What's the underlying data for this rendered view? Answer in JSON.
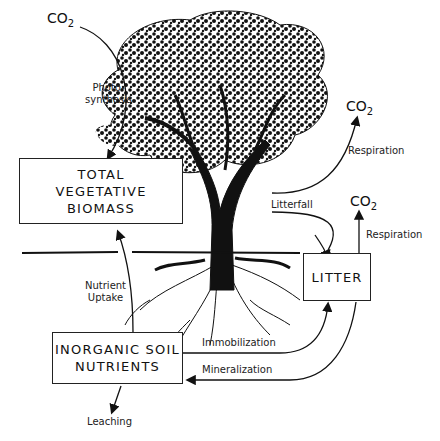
{
  "diagram": {
    "boxes": {
      "biomass": {
        "lines": [
          "TOTAL",
          "VEGETATIVE",
          "BIOMASS"
        ]
      },
      "litter": {
        "lines": [
          "LITTER"
        ]
      },
      "soil": {
        "lines": [
          "INORGANIC SOIL",
          "NUTRIENTS"
        ]
      }
    },
    "co2": {
      "text": "CO",
      "sub": "2"
    },
    "labels": {
      "photosynthesis": [
        "Photo-",
        "synthesis"
      ],
      "respiration_tree": "Respiration",
      "respiration_litter": "Respiration",
      "litterfall": "Litterfall",
      "nutrient_uptake": [
        "Nutrient",
        "Uptake"
      ],
      "immobilization": "Immobilization",
      "mineralization": "Mineralization",
      "leaching": "Leaching"
    },
    "illustration": "tree-with-roots"
  }
}
